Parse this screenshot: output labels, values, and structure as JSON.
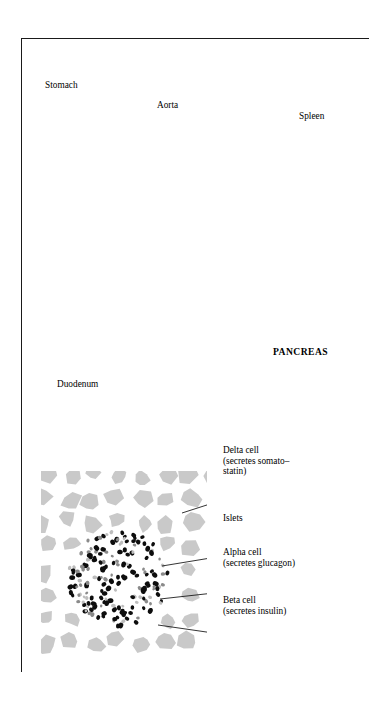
{
  "figure": {
    "title": "FIG. 1:  THE HUMAN PANCREAS",
    "border_color": "#1a1a1a",
    "background": "#ffffff"
  },
  "anatomy_labels": [
    {
      "id": "stomach",
      "text": "Stomach",
      "bold": false,
      "x": 44,
      "y": 79,
      "leader": "crossed"
    },
    {
      "id": "aorta",
      "text": "Aorta",
      "bold": false,
      "x": 156,
      "y": 99,
      "leader": "crossed"
    },
    {
      "id": "spleen",
      "text": "Spleen",
      "bold": false,
      "x": 298,
      "y": 110,
      "leader": "crossed"
    },
    {
      "id": "pancreas",
      "text": "PANCREAS",
      "bold": true,
      "x": 272,
      "y": 346,
      "leader": "straight"
    },
    {
      "id": "duodenum",
      "text": "Duodenum",
      "bold": false,
      "x": 56,
      "y": 378,
      "leader": "crossed"
    }
  ],
  "micrograph_labels": [
    {
      "id": "delta-cell",
      "lines": [
        "Delta cell",
        "(secretes somato–",
        "statin)"
      ],
      "x": 222,
      "y": 444
    },
    {
      "id": "islets",
      "lines": [
        "Islets"
      ],
      "x": 222,
      "y": 512
    },
    {
      "id": "alpha-cell",
      "lines": [
        "Alpha cell",
        "(secretes glucagon)"
      ],
      "x": 222,
      "y": 546
    },
    {
      "id": "beta-cell",
      "lines": [
        "Beta cell",
        "(secretes insulin)"
      ],
      "x": 222,
      "y": 594
    }
  ],
  "legend_colors": {
    "pancreas_mass": "#2e2e2e",
    "lobule": "#b9b9b9",
    "acinar_tissue": "#c9c9c9",
    "beta_cell": "#0d0d0d",
    "alpha_cell": "#8a8a8a",
    "delta_cell": "#bdbdbd",
    "outline": "#111111"
  },
  "structure": {
    "upper_panel": "gross anatomy of pancreas with stomach, aorta, spleen, duodenum",
    "lower_panel": "histological detail of islet of Langerhans within acinar tissue",
    "connector": "curly brace linking pancreas body to magnified histology panel"
  }
}
